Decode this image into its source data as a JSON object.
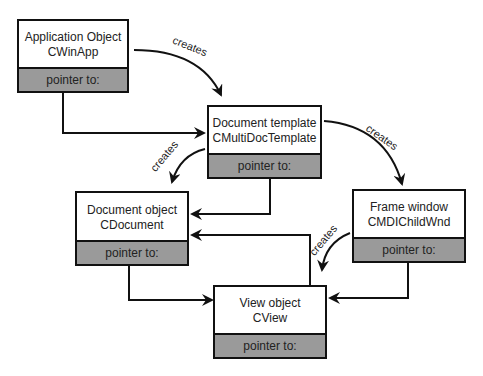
{
  "diagram": {
    "nodes": [
      {
        "id": "app",
        "title": "Application Object",
        "class": "CWinApp",
        "pointer": "pointer to:"
      },
      {
        "id": "doctemplate",
        "title": "Document template",
        "class": "CMultiDocTemplate",
        "pointer": "pointer to:"
      },
      {
        "id": "document",
        "title": "Document object",
        "class": "CDocument",
        "pointer": "pointer to:"
      },
      {
        "id": "frame",
        "title": "Frame window",
        "class": "CMDIChildWnd",
        "pointer": "pointer to:"
      },
      {
        "id": "view",
        "title": "View object",
        "class": "CView",
        "pointer": "pointer to:"
      }
    ],
    "edges": [
      {
        "from": "app",
        "to": "doctemplate",
        "label": "creates",
        "type": "creates"
      },
      {
        "from": "doctemplate",
        "to": "frame",
        "label": "creates",
        "type": "creates"
      },
      {
        "from": "doctemplate",
        "to": "document",
        "label": "creates",
        "type": "creates"
      },
      {
        "from": "frame",
        "to": "view",
        "label": "creates",
        "type": "creates"
      },
      {
        "from": "app",
        "to": "doctemplate",
        "label": "",
        "type": "pointer"
      },
      {
        "from": "doctemplate",
        "to": "document",
        "label": "",
        "type": "pointer"
      },
      {
        "from": "document",
        "to": "view",
        "label": "",
        "type": "pointer"
      },
      {
        "from": "frame",
        "to": "view",
        "label": "",
        "type": "pointer"
      },
      {
        "from": "view",
        "to": "document",
        "label": "",
        "type": "pointer"
      }
    ],
    "labels": {
      "creates": "creates"
    }
  }
}
